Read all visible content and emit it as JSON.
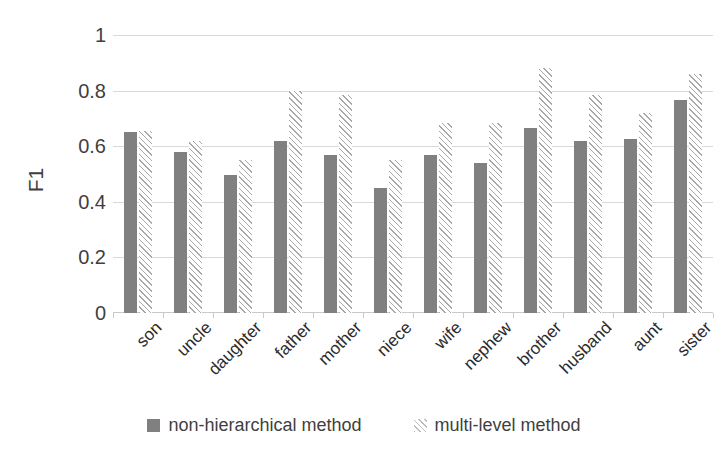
{
  "chart_data": {
    "type": "bar",
    "title": "",
    "xlabel": "",
    "ylabel": "F1",
    "ylim": [
      0,
      1
    ],
    "yticks": [
      0,
      0.2,
      0.4,
      0.6,
      0.8,
      1
    ],
    "ytick_labels": [
      "0",
      "0.2",
      "0.4",
      "0.6",
      "0.8",
      "1"
    ],
    "grid": true,
    "legend_position": "bottom",
    "categories": [
      "son",
      "uncle",
      "daughter",
      "father",
      "mother",
      "niece",
      "wife",
      "nephew",
      "brother",
      "husband",
      "aunt",
      "sister"
    ],
    "series": [
      {
        "name": "non-hierarchical method",
        "style": "solid",
        "color": "#808080",
        "values": [
          0.65,
          0.58,
          0.495,
          0.62,
          0.57,
          0.45,
          0.57,
          0.54,
          0.665,
          0.62,
          0.625,
          0.765
        ]
      },
      {
        "name": "multi-level method",
        "style": "hatched",
        "color": "#a8a8a8",
        "values": [
          0.655,
          0.62,
          0.55,
          0.8,
          0.785,
          0.55,
          0.685,
          0.685,
          0.88,
          0.785,
          0.72,
          0.86
        ]
      }
    ]
  },
  "legend": {
    "items": [
      {
        "label": "non-hierarchical method",
        "swatch": "solid-swatch-icon"
      },
      {
        "label": "multi-level method",
        "swatch": "hatched-swatch-icon"
      }
    ]
  }
}
